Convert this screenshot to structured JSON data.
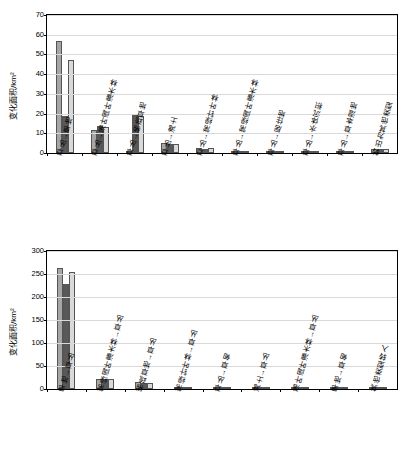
{
  "colors": {
    "series1": "#a6a6a6",
    "series2": "#595959",
    "series3": "#d9d9d9",
    "axis": "#000000",
    "grid": "#d9d9d9"
  },
  "chart_data": [
    {
      "type": "bar",
      "title": "",
      "xlabel": "",
      "ylabel": "变化面积/km²",
      "ylim": [
        0,
        70
      ],
      "yticks": [
        0,
        10,
        20,
        30,
        40,
        50,
        60,
        70
      ],
      "grid": true,
      "legend_position": "top-center",
      "categories": [
        "草丛→旱地",
        "草丛→落叶阔叶灌木林",
        "草丛→稀疏草地",
        "草丛→滩土",
        "草丛→常绿针叶林",
        "草丛→常绿阔叶灌木林",
        "草丛→居住地",
        "草丛→水体沉积",
        "草丛→草本湿地",
        "转出为其他类型"
      ],
      "series": [
        {
          "name": "1985—2000年",
          "values": [
            57.0,
            11.5,
            1.2,
            4.9,
            2.4,
            1.0,
            0.4,
            0.2,
            0.3,
            1.9
          ]
        },
        {
          "name": "2000—2013年",
          "values": [
            19.0,
            13.5,
            19.5,
            4.8,
            2.2,
            1.0,
            0.4,
            0.2,
            0.3,
            1.8
          ]
        },
        {
          "name": "1985—2013年",
          "values": [
            47.0,
            13.0,
            19.0,
            4.8,
            2.3,
            1.0,
            0.4,
            0.2,
            0.3,
            1.9
          ]
        }
      ]
    },
    {
      "type": "bar",
      "title": "",
      "xlabel": "",
      "ylabel": "变化面积/km²",
      "ylim": [
        0,
        300
      ],
      "yticks": [
        0,
        50,
        100,
        150,
        200,
        250,
        300
      ],
      "grid": true,
      "legend_position": "top-center",
      "categories": [
        "旱地→草丛",
        "常绿阔叶灌木林→草丛",
        "稀疏草地→草丛",
        "常绿针叶林→草丛",
        "草丛→草甸",
        "滩土→草丛",
        "落叶阔叶灌木林→草丛",
        "旱地→草甸",
        "其他类型转入"
      ],
      "series": [
        {
          "name": "1985—2000年",
          "values": [
            262.0,
            22.0,
            15.0,
            4.0,
            3.0,
            3.0,
            2.0,
            1.0,
            1.0
          ]
        },
        {
          "name": "2000—2013年",
          "values": [
            228.0,
            22.0,
            14.0,
            3.5,
            3.0,
            3.0,
            2.0,
            1.0,
            1.0
          ]
        },
        {
          "name": "1985—2013年",
          "values": [
            255.0,
            21.0,
            14.0,
            3.5,
            3.0,
            3.0,
            2.0,
            1.0,
            1.0
          ]
        }
      ]
    }
  ],
  "top_chart": {
    "ylabel": "变化面积/km²",
    "yticks": [
      "0",
      "10",
      "20",
      "30",
      "40",
      "50",
      "60",
      "70"
    ],
    "legend": [
      "1985—2000年",
      "2000—2013年",
      "1985—2013年"
    ],
    "xlabels": [
      "草丛→旱地",
      "草丛→落叶阔叶灌木林",
      "草丛→稀疏草地",
      "草丛→滩土",
      "草丛→常绿针叶林",
      "草丛→常绿阔叶灌木林",
      "草丛→居住地",
      "草丛→水体沉积",
      "草丛→草本湿地",
      "转出为其他类型"
    ]
  },
  "bottom_chart": {
    "ylabel": "变化面积/km²",
    "yticks": [
      "0",
      "50",
      "100",
      "150",
      "200",
      "250",
      "300"
    ],
    "legend": [
      "1985—2000年",
      "2000—2013年",
      "1985—2013年"
    ],
    "xlabels": [
      "旱地→草丛",
      "常绿阔叶灌木林→草丛",
      "稀疏草地→草丛",
      "常绿针叶林→草丛",
      "草丛→草甸",
      "滩土→草丛",
      "落叶阔叶灌木林→草丛",
      "旱地→草甸",
      "其他类型转入"
    ]
  }
}
